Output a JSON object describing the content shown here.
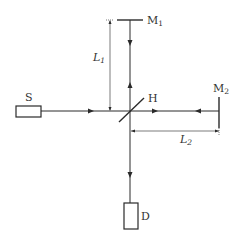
{
  "diagram": {
    "type": "michelson-interferometer",
    "components": {
      "source": {
        "label": "S"
      },
      "beam_splitter": {
        "label": "H"
      },
      "mirror_1": {
        "label": "M",
        "subscript": "1"
      },
      "mirror_2": {
        "label": "M",
        "subscript": "2"
      },
      "detector": {
        "label": "D"
      }
    },
    "dimensions": {
      "arm_1": {
        "label": "L",
        "subscript": "1"
      },
      "arm_2": {
        "label": "L",
        "subscript": "2"
      }
    },
    "colors": {
      "line": "#2a2a2a",
      "text": "#333333",
      "background": "#ffffff"
    }
  }
}
